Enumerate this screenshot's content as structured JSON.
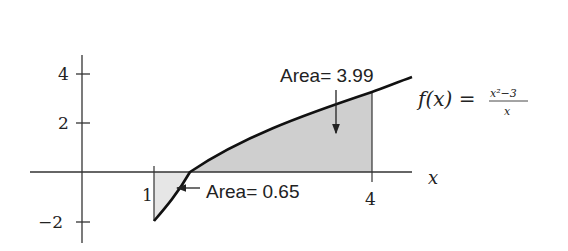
{
  "diagram": {
    "function_label": "f(x) =",
    "function_num": "x²−3",
    "function_den": "x",
    "x_axis_label": "x",
    "y_ticks": [
      {
        "label": "4",
        "value": 4
      },
      {
        "label": "2",
        "value": 2
      },
      {
        "label": "−2",
        "value": -2
      }
    ],
    "x_ticks": [
      {
        "label": "1",
        "value": 1
      },
      {
        "label": "4",
        "value": 4
      }
    ],
    "area_positive_label": "Area= 3.99",
    "area_negative_label": "Area= 0.65",
    "shade_color": "#cfcfcf",
    "curve_color": "#111111"
  }
}
